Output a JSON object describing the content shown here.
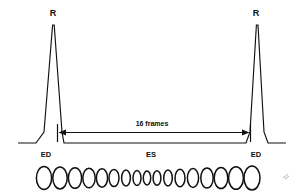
{
  "figure": {
    "background_color": "#ffffff",
    "ink_color": "#101010",
    "labels": {
      "r_peak_left": "R",
      "r_peak_right": "R",
      "ed_left": "ED",
      "ed_right": "ED",
      "es_center": "ES",
      "span_label": "16 frames"
    }
  },
  "chart_data": {
    "type": "line",
    "xlabel": "",
    "ylabel": "",
    "grid": false,
    "legend_position": "none",
    "annotations": [
      {
        "name": "r-peak-left",
        "text": "R",
        "x": 53,
        "y": 14
      },
      {
        "name": "r-peak-right",
        "text": "R",
        "x": 253,
        "y": 14
      },
      {
        "name": "ed-left",
        "text": "ED",
        "x": 46,
        "y": 154
      },
      {
        "name": "es-center",
        "text": "ES",
        "x": 151,
        "y": 154
      },
      {
        "name": "ed-right",
        "text": "ED",
        "x": 255,
        "y": 154
      },
      {
        "name": "frame-span",
        "text": "16 frames",
        "x": 152,
        "y": 123
      }
    ],
    "series": [
      {
        "name": "ecg-trace",
        "points": [
          [
            18,
            143
          ],
          [
            36,
            143
          ],
          [
            44,
            132
          ],
          [
            52,
            25
          ],
          [
            54,
            25
          ],
          [
            62,
            132
          ],
          [
            64,
            143
          ],
          [
            246,
            143
          ],
          [
            250,
            132
          ],
          [
            256,
            25
          ],
          [
            258,
            25
          ],
          [
            264,
            132
          ],
          [
            268,
            143
          ],
          [
            286,
            143
          ]
        ]
      }
    ],
    "measurement": {
      "name": "frame-span-measure",
      "label": "16 frames",
      "frames": 16,
      "x_start": 57,
      "x_end": 251,
      "y": 132,
      "tick_top": 124,
      "tick_bottom": 142
    },
    "ellipses": {
      "name": "ventricular-outline-series",
      "count": 17,
      "center_y": 178,
      "items": [
        {
          "cx": 44,
          "rx": 7.6,
          "ry": 11.5
        },
        {
          "cx": 60,
          "rx": 7.2,
          "ry": 11.0
        },
        {
          "cx": 75,
          "rx": 6.6,
          "ry": 10.3
        },
        {
          "cx": 89,
          "rx": 6.2,
          "ry": 9.8
        },
        {
          "cx": 102,
          "rx": 5.6,
          "ry": 9.2
        },
        {
          "cx": 114,
          "rx": 5.0,
          "ry": 8.6
        },
        {
          "cx": 126,
          "rx": 4.4,
          "ry": 8.0
        },
        {
          "cx": 137,
          "rx": 4.0,
          "ry": 7.4
        },
        {
          "cx": 147,
          "rx": 3.7,
          "ry": 7.0
        },
        {
          "cx": 157,
          "rx": 3.9,
          "ry": 7.3
        },
        {
          "cx": 168,
          "rx": 4.3,
          "ry": 7.9
        },
        {
          "cx": 180,
          "rx": 5.0,
          "ry": 8.7
        },
        {
          "cx": 193,
          "rx": 5.6,
          "ry": 9.4
        },
        {
          "cx": 207,
          "rx": 6.2,
          "ry": 10.0
        },
        {
          "cx": 221,
          "rx": 6.8,
          "ry": 10.6
        },
        {
          "cx": 236,
          "rx": 7.4,
          "ry": 11.3
        },
        {
          "cx": 252,
          "rx": 8.0,
          "ry": 12.0
        }
      ]
    }
  }
}
